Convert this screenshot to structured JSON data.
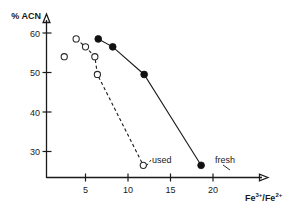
{
  "chart_data": {
    "type": "scatter",
    "title": "",
    "subtitle": "",
    "xlabel": "Fe3+/Fe2+",
    "xlabel_parts": {
      "base1": "Fe",
      "sup1": "3+",
      "separator": "/",
      "base2": "Fe",
      "sup2": "2+"
    },
    "ylabel": "% ACN",
    "xlim": [
      0,
      22.5
    ],
    "ylim": [
      24,
      62
    ],
    "xticks": [
      5,
      10,
      15,
      20
    ],
    "xtick_labels": [
      "5",
      "10",
      "15",
      "20"
    ],
    "yticks": [
      30,
      40,
      50,
      60
    ],
    "ytick_labels": [
      "30",
      "40",
      "50",
      "60"
    ],
    "grid": false,
    "legend_position": "inline-annotations",
    "series": [
      {
        "name": "used",
        "marker": "open-circle",
        "linestyle": "dashed",
        "label": "used",
        "points": [
          {
            "x": 2.5,
            "y": 54.0,
            "connected": false
          },
          {
            "x": 3.9,
            "y": 58.5,
            "connected": true
          },
          {
            "x": 5.0,
            "y": 56.5,
            "connected": true
          },
          {
            "x": 6.1,
            "y": 54.0,
            "connected": true
          },
          {
            "x": 6.4,
            "y": 49.5,
            "connected": true
          },
          {
            "x": 11.8,
            "y": 26.5,
            "connected": true
          }
        ]
      },
      {
        "name": "fresh",
        "marker": "filled-circle",
        "linestyle": "solid",
        "label": "fresh",
        "points": [
          {
            "x": 6.5,
            "y": 58.5,
            "connected": true
          },
          {
            "x": 8.2,
            "y": 56.5,
            "connected": true
          },
          {
            "x": 11.9,
            "y": 49.5,
            "connected": true
          },
          {
            "x": 18.6,
            "y": 26.5,
            "connected": true
          }
        ]
      }
    ],
    "annotations": [
      {
        "text": "used",
        "x": 9.5,
        "y": 31.0,
        "points_to": {
          "x": 11.8,
          "y": 26.5
        }
      },
      {
        "text": "fresh",
        "x": 17.0,
        "y": 31.0,
        "points_to": {
          "x": 18.6,
          "y": 26.5
        }
      }
    ]
  }
}
